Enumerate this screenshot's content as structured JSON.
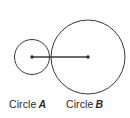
{
  "figure": {
    "background_color": "#fefefe",
    "stroke_color": "#3a3a3a",
    "text_color": "#2a2a2a",
    "width": 130,
    "height": 118
  },
  "labels": {
    "circle_a": {
      "name": "Circle",
      "id": "A"
    },
    "circle_b": {
      "name": "Circle",
      "id": "B"
    }
  },
  "chart_data": {
    "type": "diagram",
    "shapes": [
      {
        "name": "circle-a",
        "kind": "circle",
        "cx": 32,
        "cy": 57,
        "r": 17.5,
        "fill": "none",
        "stroke": "#3a3a3a",
        "stroke_width": 1
      },
      {
        "name": "circle-b",
        "kind": "circle",
        "cx": 88,
        "cy": 57,
        "r": 37,
        "fill": "none",
        "stroke": "#3a3a3a",
        "stroke_width": 1
      },
      {
        "name": "center-line",
        "kind": "line",
        "x1": 32,
        "y1": 57,
        "x2": 88,
        "y2": 57,
        "stroke": "#3a3a3a",
        "stroke_width": 1.4
      },
      {
        "name": "center-dot-a",
        "kind": "dot",
        "cx": 32,
        "cy": 57,
        "r": 1.6,
        "fill": "#2a2a2a"
      },
      {
        "name": "center-dot-b",
        "kind": "dot",
        "cx": 88,
        "cy": 57,
        "r": 1.6,
        "fill": "#2a2a2a"
      }
    ],
    "annotations": [
      {
        "text": "Circle A",
        "x": 9,
        "y": 104
      },
      {
        "text": "Circle B",
        "x": 66,
        "y": 104
      }
    ]
  }
}
